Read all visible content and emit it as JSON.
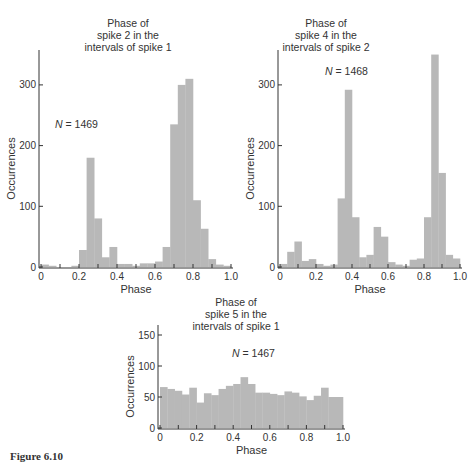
{
  "caption": "Figure 6.10",
  "colors": {
    "bar": "#b8b8b8",
    "axis": "#333333"
  },
  "chart_data": [
    {
      "type": "bar",
      "id": "chart1",
      "title": [
        "Phase of",
        "spike 2 in the",
        "intervals of spike 1"
      ],
      "annotation": "N = 1469",
      "xlabel": "Phase",
      "ylabel": "Occurrences",
      "xlim": [
        0,
        1.0
      ],
      "ylim": [
        0,
        350
      ],
      "xticks": [
        "0",
        "0.2",
        "0.4",
        "0.6",
        "0.8",
        "1.0"
      ],
      "yticks": [
        0,
        100,
        200,
        300
      ],
      "bin_width": 0.04,
      "values": [
        4,
        2,
        0,
        0,
        2,
        28,
        180,
        80,
        16,
        33,
        5,
        5,
        2,
        6,
        6,
        9,
        33,
        235,
        300,
        310,
        110,
        63,
        13,
        4,
        2
      ],
      "layout": {
        "x0": 41,
        "x1": 231,
        "y0": 267,
        "ppu": 0.607,
        "ytop": 50,
        "title_x": 128,
        "title_y": 27,
        "n_x": 55,
        "n_y": 128
      }
    },
    {
      "type": "bar",
      "id": "chart2",
      "title": [
        "Phase of",
        "spike 4 in the",
        "intervals of spike 2"
      ],
      "annotation": "N = 1468",
      "xlabel": "Phase",
      "ylabel": "Occurrences",
      "xlim": [
        0,
        1.0
      ],
      "ylim": [
        0,
        350
      ],
      "xticks": [
        "0",
        "0.2",
        "0.4",
        "0.6",
        "0.8",
        "1.0"
      ],
      "yticks": [
        0,
        100,
        200,
        300
      ],
      "bin_width": 0.04,
      "values": [
        5,
        25,
        42,
        10,
        13,
        5,
        2,
        4,
        113,
        292,
        82,
        16,
        20,
        66,
        50,
        8,
        4,
        2,
        12,
        14,
        82,
        350,
        155,
        20,
        14
      ],
      "layout": {
        "x0": 280,
        "x1": 460,
        "y0": 267,
        "ppu": 0.607,
        "ytop": 50,
        "title_x": 326,
        "title_y": 27,
        "n_x": 325,
        "n_y": 75
      }
    },
    {
      "type": "bar",
      "id": "chart3",
      "title": [
        "Phase of",
        "spike 5 in the",
        "intervals of spike 1"
      ],
      "annotation": "N = 1467",
      "xlabel": "Phase",
      "ylabel": "Occurrences",
      "xlim": [
        0,
        1.0
      ],
      "ylim": [
        0,
        170
      ],
      "xticks": [
        "0",
        "0.2",
        "0.4",
        "0.6",
        "0.8",
        "1.0"
      ],
      "yticks": [
        0,
        50,
        100,
        150
      ],
      "bin_width": 0.04,
      "values": [
        66,
        63,
        60,
        54,
        65,
        41,
        56,
        53,
        63,
        68,
        71,
        82,
        71,
        57,
        57,
        55,
        53,
        59,
        57,
        51,
        45,
        52,
        65,
        50,
        50
      ],
      "layout": {
        "x0": 160,
        "x1": 343,
        "y0": 428,
        "ppu": 0.62,
        "ytop": 325,
        "title_x": 236,
        "title_y": 306,
        "n_x": 232,
        "n_y": 357
      }
    }
  ]
}
